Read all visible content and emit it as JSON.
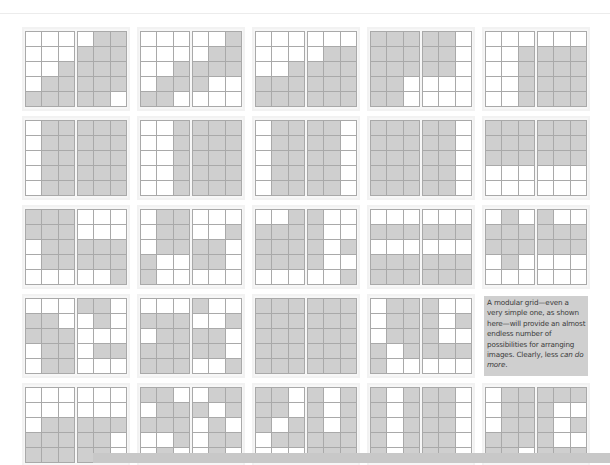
{
  "figure": {
    "colors": {
      "background": "#ffffff",
      "grid_line": "#a9a9a9",
      "module_empty": "#ffffff",
      "module_filled": "#cfcfcf",
      "caption_background": "#cfcfcf",
      "bottom_bar": "#c8c8c8"
    },
    "grid": {
      "columns_per_page": 3,
      "rows_per_page": 5,
      "spread_rows": 5,
      "spread_columns": 5
    },
    "caption": {
      "text_main": "A modular grid—even a very simple one, as shown here—will provide an almost endless number of possibilities for arranging images. Clearly, less ",
      "text_emphasis": "can do more",
      "text_end": "."
    },
    "spreads": [
      {
        "left": [
          "000",
          "000",
          "001",
          "011",
          "111"
        ],
        "right": [
          "011",
          "111",
          "111",
          "111",
          "110"
        ]
      },
      {
        "left": [
          "000",
          "000",
          "001",
          "011",
          "110"
        ],
        "right": [
          "001",
          "011",
          "111",
          "100",
          "000"
        ]
      },
      {
        "left": [
          "000",
          "000",
          "001",
          "111",
          "111"
        ],
        "right": [
          "000",
          "011",
          "111",
          "111",
          "111"
        ]
      },
      {
        "left": [
          "111",
          "111",
          "111",
          "110",
          "110"
        ],
        "right": [
          "110",
          "110",
          "110",
          "000",
          "000"
        ]
      },
      {
        "left": [
          "000",
          "001",
          "001",
          "001",
          "001"
        ],
        "right": [
          "000",
          "111",
          "111",
          "111",
          "111"
        ]
      },
      {
        "left": [
          "011",
          "011",
          "011",
          "011",
          "011"
        ],
        "right": [
          "111",
          "111",
          "111",
          "111",
          "111"
        ]
      },
      {
        "left": [
          "001",
          "001",
          "001",
          "001",
          "001"
        ],
        "right": [
          "111",
          "111",
          "111",
          "111",
          "111"
        ]
      },
      {
        "left": [
          "011",
          "011",
          "011",
          "011",
          "011"
        ],
        "right": [
          "110",
          "110",
          "110",
          "110",
          "110"
        ]
      },
      {
        "left": [
          "111",
          "111",
          "111",
          "111",
          "111"
        ],
        "right": [
          "110",
          "110",
          "110",
          "110",
          "110"
        ]
      },
      {
        "left": [
          "111",
          "111",
          "111",
          "000",
          "000"
        ],
        "right": [
          "111",
          "111",
          "111",
          "000",
          "000"
        ]
      },
      {
        "left": [
          "111",
          "111",
          "011",
          "011",
          "000"
        ],
        "right": [
          "000",
          "000",
          "111",
          "111",
          "001"
        ]
      },
      {
        "left": [
          "011",
          "011",
          "011",
          "100",
          "100"
        ],
        "right": [
          "000",
          "001",
          "110",
          "110",
          "000"
        ]
      },
      {
        "left": [
          "001",
          "111",
          "111",
          "111",
          "000"
        ],
        "right": [
          "100",
          "100",
          "101",
          "100",
          "001"
        ]
      },
      {
        "left": [
          "000",
          "111",
          "000",
          "111",
          "111"
        ],
        "right": [
          "000",
          "111",
          "000",
          "111",
          "111"
        ]
      },
      {
        "left": [
          "010",
          "111",
          "111",
          "010",
          "000"
        ],
        "right": [
          "100",
          "111",
          "111",
          "000",
          "000"
        ]
      },
      {
        "left": [
          "000",
          "110",
          "111",
          "011",
          "011"
        ],
        "right": [
          "110",
          "010",
          "000",
          "011",
          "000"
        ]
      },
      {
        "left": [
          "000",
          "111",
          "011",
          "111",
          "111"
        ],
        "right": [
          "100",
          "001",
          "110",
          "110",
          "001"
        ]
      },
      {
        "left": [
          "111",
          "111",
          "111",
          "111",
          "111"
        ],
        "right": [
          "111",
          "111",
          "111",
          "111",
          "111"
        ]
      },
      {
        "left": [
          "011",
          "011",
          "011",
          "101",
          "100"
        ],
        "right": [
          "100",
          "101",
          "100",
          "111",
          "000"
        ]
      },
      {
        "caption": true
      },
      {
        "left": [
          "000",
          "000",
          "011",
          "111",
          "111"
        ],
        "right": [
          "000",
          "000",
          "111",
          "110",
          "110"
        ]
      },
      {
        "left": [
          "110",
          "011",
          "111",
          "001",
          "010"
        ],
        "right": [
          "011",
          "101",
          "010",
          "011",
          "010"
        ]
      },
      {
        "left": [
          "110",
          "110",
          "101",
          "011",
          "000"
        ],
        "right": [
          "101",
          "101",
          "101",
          "111",
          "111"
        ]
      },
      {
        "left": [
          "101",
          "101",
          "101",
          "101",
          "101"
        ],
        "right": [
          "110",
          "110",
          "110",
          "110",
          "110"
        ]
      },
      {
        "left": [
          "011",
          "011",
          "011",
          "111",
          "110"
        ],
        "right": [
          "111",
          "100",
          "101",
          "100",
          "111"
        ]
      }
    ]
  }
}
